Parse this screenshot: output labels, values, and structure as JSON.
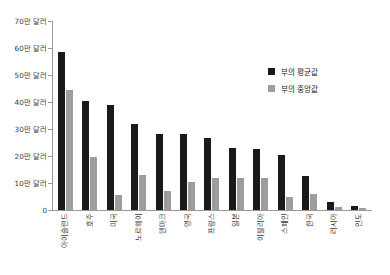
{
  "chart_data": {
    "type": "bar",
    "title": "",
    "xlabel": "",
    "ylabel": "",
    "ylim": [
      0,
      700000
    ],
    "grid": false,
    "legend_position": "top-right",
    "unit_note": "만 달러 (10,000 USD)",
    "categories": [
      "아이슬란드",
      "호주",
      "미국",
      "노르웨이",
      "덴마크",
      "영국",
      "프랑스",
      "일본",
      "이탈리아",
      "스페인",
      "한국",
      "러시아",
      "인도"
    ],
    "tick_labels": [
      "0",
      "10만 달러",
      "20만 달러",
      "30만 달러",
      "40만 달러",
      "50만 달러",
      "60만 달러",
      "70만 달러"
    ],
    "tick_values": [
      0,
      10,
      20,
      30,
      40,
      50,
      60,
      70
    ],
    "series": [
      {
        "name": "부의 평균값",
        "color": "#1a1a1a",
        "values": [
          58.5,
          40.5,
          39,
          32,
          28,
          28,
          26.5,
          23,
          22.5,
          20.5,
          12.5,
          3,
          1.5
        ]
      },
      {
        "name": "부의 중앙값",
        "color": "#9d9d9d",
        "values": [
          44.5,
          19.5,
          5.5,
          13,
          7,
          10.5,
          12,
          12,
          12,
          5,
          6,
          1,
          0.7
        ]
      }
    ]
  },
  "legend": {
    "items": [
      {
        "label": "부의 평균값",
        "color": "#1a1a1a"
      },
      {
        "label": "부의 중앙값",
        "color": "#9d9d9d"
      }
    ]
  }
}
